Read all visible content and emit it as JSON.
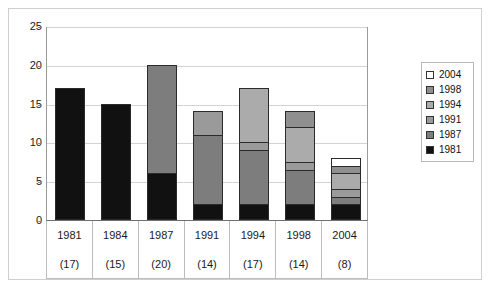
{
  "chart_data": {
    "type": "bar",
    "title": "",
    "subtitle": "",
    "xlabel": "",
    "ylabel": "",
    "stacked": true,
    "grid": true,
    "legend_position": "right",
    "ylim": [
      0,
      25
    ],
    "yticks": [
      0,
      5,
      10,
      15,
      20,
      25
    ],
    "categories": [
      "1981",
      "1984",
      "1987",
      "1991",
      "1994",
      "1998",
      "2004"
    ],
    "category_totals": [
      "(17)",
      "(15)",
      "(20)",
      "(14)",
      "(17)",
      "(14)",
      "(8)"
    ],
    "totals": [
      17,
      15,
      20,
      14,
      17,
      14,
      8
    ],
    "series": [
      {
        "name": "1981",
        "color": "#111111",
        "values": [
          17,
          15,
          6,
          2,
          2,
          2,
          2
        ]
      },
      {
        "name": "1987",
        "color": "#7d7d7d",
        "values": [
          0,
          0,
          14,
          9,
          7,
          4.5,
          1
        ]
      },
      {
        "name": "1991",
        "color": "#9a9a9a",
        "values": [
          0,
          0,
          0,
          3,
          1,
          1,
          1
        ]
      },
      {
        "name": "1994",
        "color": "#ababab",
        "values": [
          0,
          0,
          0,
          0,
          7,
          4.5,
          2
        ]
      },
      {
        "name": "1998",
        "color": "#8f8f8f",
        "values": [
          0,
          0,
          0,
          0,
          0,
          2,
          1
        ]
      },
      {
        "name": "2004",
        "color": "#ffffff",
        "values": [
          0,
          0,
          0,
          0,
          0,
          0,
          1
        ]
      }
    ]
  },
  "legend": {
    "items": [
      {
        "label": "2004",
        "color": "#ffffff"
      },
      {
        "label": "1998",
        "color": "#8f8f8f"
      },
      {
        "label": "1994",
        "color": "#ababab"
      },
      {
        "label": "1991",
        "color": "#9a9a9a"
      },
      {
        "label": "1987",
        "color": "#7d7d7d"
      },
      {
        "label": "1981",
        "color": "#111111"
      }
    ]
  },
  "axis": {
    "y_tick_labels": [
      "0",
      "5",
      "10",
      "15",
      "20",
      "25"
    ]
  },
  "artifact": {
    "mark": ""
  }
}
